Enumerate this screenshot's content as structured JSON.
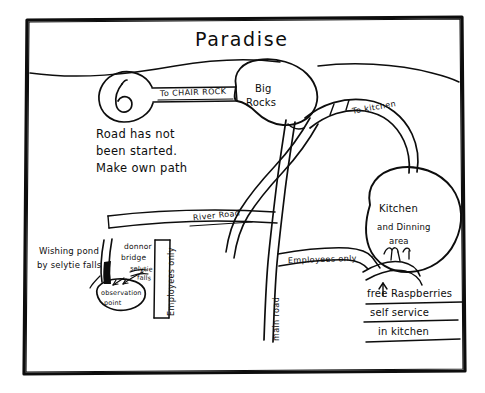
{
  "map": {
    "title": "Paradise",
    "frame": "hand-drawn rectangular border",
    "ink_color": "#0d0d0d",
    "paper_color": "#ffffff"
  },
  "places": [
    {
      "id": "big-rocks",
      "label_line1": "Big",
      "label_line2": "Rocks"
    },
    {
      "id": "kitchen",
      "label_line1": "Kitchen",
      "label_line2": "and Dinning",
      "label_line3": "area"
    },
    {
      "id": "observation-point",
      "label_line1": "observation",
      "label_line2": "point"
    },
    {
      "id": "turnaround-loop",
      "label": ""
    }
  ],
  "roads": [
    {
      "id": "to-chair-rock",
      "label": "To CHAIR ROCK"
    },
    {
      "id": "to-kitchen",
      "label": "To kitchen"
    },
    {
      "id": "river-road",
      "label": "River Road"
    },
    {
      "id": "main-road",
      "label": "main road"
    },
    {
      "id": "employees-only-vertical",
      "label": "Employees only"
    },
    {
      "id": "employees-only-horizontal",
      "label": "Employees only"
    }
  ],
  "annotations": {
    "road_note": {
      "line1": "Road has not",
      "line2": "been started.",
      "line3": "Make own path"
    },
    "pond_note": {
      "line1": "Wishing pond",
      "line2": "by selytie falls"
    },
    "bridge_note": {
      "line1": "donnor",
      "line2": "bridge",
      "line3": "selytie",
      "line4": "falls"
    },
    "raspberry_note": {
      "line1": "free Raspberries",
      "line2": "self service",
      "line3": "in kitchen"
    }
  }
}
